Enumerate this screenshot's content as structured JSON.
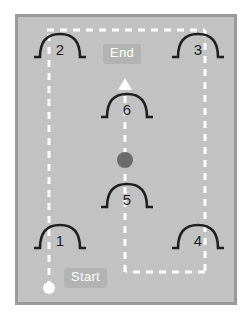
{
  "diagram": {
    "type": "sports-drill-diagram",
    "colors": {
      "field_background": "#c2c2c2",
      "field_border": "#9a9a9a",
      "path_line": "#ffffff",
      "hurdle_stroke": "#1f1f1f",
      "hurdle_label": "#1f1f1f",
      "start_marker": "#ffffff",
      "cone_marker": "#6b6b6b",
      "badge_background": "#b0b0b0",
      "badge_text": "#ffffff"
    },
    "field": {
      "x": 15,
      "y": 14,
      "width": 222,
      "height": 291,
      "border_width": 3
    }
  },
  "markers": {
    "start": {
      "label": "Start",
      "shape": "filled-circle",
      "color": "#ffffff",
      "cx": 49,
      "cy": 288,
      "r": 6
    },
    "end": {
      "label": "End",
      "shape": "triangle-up",
      "color": "#ffffff",
      "cx": 125,
      "cy": 86
    },
    "cone": {
      "label": "",
      "shape": "filled-circle",
      "color": "#6b6b6b",
      "cx": 125,
      "cy": 160,
      "r": 8
    }
  },
  "hurdles": [
    {
      "label": "1",
      "cx": 60,
      "cy": 248,
      "position": "bottom-left"
    },
    {
      "label": "2",
      "cx": 60,
      "cy": 57,
      "position": "top-left"
    },
    {
      "label": "3",
      "cx": 198,
      "cy": 57,
      "position": "top-right"
    },
    {
      "label": "4",
      "cx": 198,
      "cy": 248,
      "position": "bottom-right"
    },
    {
      "label": "5",
      "cx": 127,
      "cy": 207,
      "position": "center-lower"
    },
    {
      "label": "6",
      "cx": 127,
      "cy": 117,
      "position": "center-upper"
    }
  ],
  "path": {
    "style": "dashed",
    "color": "#ffffff",
    "dash": "7 6",
    "width": 3,
    "segments": [
      {
        "name": "left-vertical",
        "x1": 49,
        "y1": 288,
        "x2": 49,
        "y2": 30
      },
      {
        "name": "top-horizontal",
        "x1": 47,
        "y1": 30,
        "x2": 205,
        "y2": 30
      },
      {
        "name": "right-vertical",
        "x1": 205,
        "y1": 30,
        "x2": 205,
        "y2": 272
      },
      {
        "name": "bottom-horizontal",
        "x1": 205,
        "y1": 272,
        "x2": 126,
        "y2": 272
      },
      {
        "name": "center-vertical",
        "x1": 125,
        "y1": 272,
        "x2": 125,
        "y2": 88
      }
    ]
  },
  "labels": {
    "start_badge": "Start",
    "end_badge": "End"
  }
}
